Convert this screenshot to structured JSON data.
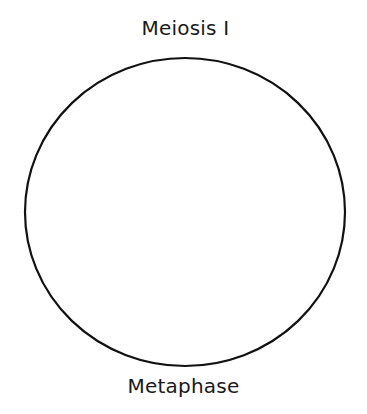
{
  "diagram": {
    "title": "Meiosis I",
    "caption": "Metaphase",
    "cell": {
      "shape": "circle",
      "cx": 185,
      "cy": 212,
      "rx": 160,
      "ry": 154,
      "stroke": "#111111",
      "stroke_width": 2.2,
      "fill": "#ffffff"
    }
  }
}
